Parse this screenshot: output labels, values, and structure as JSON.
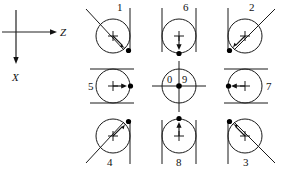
{
  "figure": {
    "background_color": "#ffffff",
    "stroke_color": "#1a1a1a",
    "width": 284,
    "height": 172
  },
  "axes": {
    "origin": {
      "x": 16,
      "y": 32
    },
    "horizontal": {
      "name": "z-axis",
      "label": "Z",
      "direction": "right",
      "tip": {
        "x": 57,
        "y": 32
      },
      "label_pos": {
        "x": 60,
        "y": 36
      }
    },
    "vertical": {
      "name": "x-axis",
      "label": "X",
      "direction": "down",
      "tip": {
        "x": 16,
        "y": 64
      },
      "label_pos": {
        "x": 12,
        "y": 81
      }
    },
    "horizontal_start": {
      "x": 2,
      "y": 32
    },
    "vertical_start": {
      "x": 16,
      "y": 10
    }
  },
  "grid": {
    "columns": 3,
    "rows": 3,
    "cell_centers": [
      {
        "x": 113,
        "y": 36
      },
      {
        "x": 179,
        "y": 36
      },
      {
        "x": 245,
        "y": 36
      },
      {
        "x": 113,
        "y": 86
      },
      {
        "x": 179,
        "y": 86
      },
      {
        "x": 245,
        "y": 86
      },
      {
        "x": 113,
        "y": 136
      },
      {
        "x": 179,
        "y": 136
      },
      {
        "x": 245,
        "y": 136
      }
    ],
    "circle_radius": 17
  },
  "cells": [
    {
      "id": "cell-1",
      "label": "1",
      "label_pos": {
        "x": 117,
        "y": 11
      },
      "center": {
        "x": 113,
        "y": 36
      },
      "radius": 17,
      "arrow_angle_deg": 45,
      "arrow_description": "center to lower-right",
      "constraints": [
        {
          "type": "diagonal",
          "description": "diagonal tangent from upper-left",
          "x1": 86,
          "y1": 9,
          "x2": 124,
          "y2": 50
        },
        {
          "type": "vertical",
          "description": "vertical tangent on right",
          "x1": 130,
          "y1": 8,
          "x2": 130,
          "y2": 52
        }
      ]
    },
    {
      "id": "cell-6",
      "label": "6",
      "label_pos": {
        "x": 183,
        "y": 11
      },
      "center": {
        "x": 179,
        "y": 36
      },
      "radius": 17,
      "arrow_angle_deg": 90,
      "arrow_description": "center downward",
      "constraints": [
        {
          "type": "vertical",
          "description": "vertical tangent on left",
          "x1": 162,
          "y1": 8,
          "x2": 162,
          "y2": 52
        },
        {
          "type": "vertical",
          "description": "vertical tangent on right",
          "x1": 196,
          "y1": 8,
          "x2": 196,
          "y2": 52
        }
      ]
    },
    {
      "id": "cell-2",
      "label": "2",
      "label_pos": {
        "x": 249,
        "y": 11
      },
      "center": {
        "x": 245,
        "y": 36
      },
      "radius": 17,
      "arrow_angle_deg": 225,
      "arrow_description": "center to lower-left",
      "constraints": [
        {
          "type": "vertical",
          "description": "vertical tangent on left",
          "x1": 228,
          "y1": 8,
          "x2": 228,
          "y2": 52
        },
        {
          "type": "diagonal",
          "description": "diagonal tangent to upper-right",
          "x1": 234,
          "y1": 50,
          "x2": 275,
          "y2": 9
        }
      ]
    },
    {
      "id": "cell-5",
      "label": "5",
      "label_pos": {
        "x": 88,
        "y": 90
      },
      "center": {
        "x": 113,
        "y": 86
      },
      "radius": 17,
      "arrow_angle_deg": 0,
      "arrow_description": "center to right",
      "constraints": [
        {
          "type": "horizontal",
          "description": "horizontal tangent on top",
          "x1": 90,
          "y1": 69,
          "x2": 134,
          "y2": 69
        },
        {
          "type": "horizontal",
          "description": "horizontal tangent on bottom",
          "x1": 90,
          "y1": 103,
          "x2": 134,
          "y2": 103
        }
      ]
    },
    {
      "id": "cell-center",
      "label_left": "0",
      "label_right": "9",
      "label_left_pos": {
        "x": 170,
        "y": 83
      },
      "label_right_pos": {
        "x": 184,
        "y": 83
      },
      "center": {
        "x": 179,
        "y": 86
      },
      "radius": 17,
      "arrow_description": "no arrow; stationary center dot",
      "constraints": [
        {
          "type": "horizontal",
          "description": "horizontal crosshair through center",
          "x1": 152,
          "y1": 86,
          "x2": 206,
          "y2": 86
        },
        {
          "type": "vertical",
          "description": "vertical crosshair through center",
          "x1": 179,
          "y1": 61,
          "x2": 179,
          "y2": 112
        }
      ]
    },
    {
      "id": "cell-7",
      "label": "7",
      "label_pos": {
        "x": 266,
        "y": 90
      },
      "center": {
        "x": 245,
        "y": 86
      },
      "radius": 17,
      "arrow_angle_deg": 180,
      "arrow_description": "center to left",
      "constraints": [
        {
          "type": "horizontal",
          "description": "horizontal tangent on top",
          "x1": 224,
          "y1": 69,
          "x2": 268,
          "y2": 69
        },
        {
          "type": "horizontal",
          "description": "horizontal tangent on bottom",
          "x1": 224,
          "y1": 103,
          "x2": 268,
          "y2": 103
        }
      ]
    },
    {
      "id": "cell-4",
      "label": "4",
      "label_pos": {
        "x": 107,
        "y": 164
      },
      "center": {
        "x": 113,
        "y": 136
      },
      "radius": 17,
      "arrow_angle_deg": 315,
      "arrow_description": "center to upper-right",
      "constraints": [
        {
          "type": "diagonal",
          "description": "diagonal tangent from lower-left",
          "x1": 86,
          "y1": 163,
          "x2": 124,
          "y2": 122
        },
        {
          "type": "vertical",
          "description": "vertical tangent on right",
          "x1": 130,
          "y1": 120,
          "x2": 130,
          "y2": 164
        }
      ]
    },
    {
      "id": "cell-8",
      "label": "8",
      "label_pos": {
        "x": 176,
        "y": 164
      },
      "center": {
        "x": 179,
        "y": 136
      },
      "radius": 17,
      "arrow_angle_deg": 270,
      "arrow_description": "center upward",
      "constraints": [
        {
          "type": "vertical",
          "description": "vertical tangent on left",
          "x1": 162,
          "y1": 120,
          "x2": 162,
          "y2": 164
        },
        {
          "type": "vertical",
          "description": "vertical tangent on right",
          "x1": 196,
          "y1": 120,
          "x2": 196,
          "y2": 164
        }
      ]
    },
    {
      "id": "cell-3",
      "label": "3",
      "label_pos": {
        "x": 243,
        "y": 164
      },
      "center": {
        "x": 245,
        "y": 136
      },
      "radius": 17,
      "arrow_angle_deg": 135,
      "arrow_description": "center to upper-left",
      "constraints": [
        {
          "type": "vertical",
          "description": "vertical tangent on left",
          "x1": 228,
          "y1": 120,
          "x2": 228,
          "y2": 164
        },
        {
          "type": "diagonal",
          "description": "diagonal tangent to lower-right",
          "x1": 234,
          "y1": 122,
          "x2": 275,
          "y2": 163
        }
      ]
    }
  ]
}
